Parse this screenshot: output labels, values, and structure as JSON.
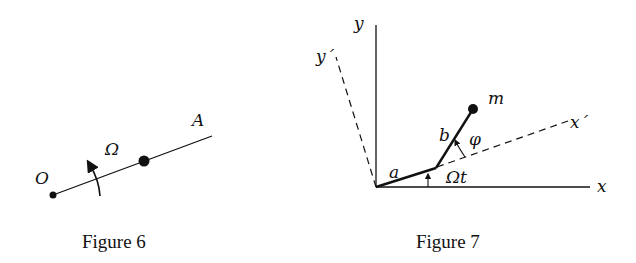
{
  "figures": [
    {
      "caption": "Figure 6",
      "labels": {
        "origin": "O",
        "end": "A",
        "omega": "Ω"
      },
      "elements": [
        "rod O-A",
        "bead on rod",
        "rotation arrow Ω"
      ]
    },
    {
      "caption": "Figure 7",
      "labels": {
        "x": "x",
        "y": "y",
        "x_prime": "x´",
        "y_prime": "y´",
        "a": "a",
        "b": "b",
        "m": "m",
        "phi": "φ",
        "omega_t": "Ωt"
      },
      "elements": [
        "fixed axes x,y",
        "rotating dashed axes x´,y´",
        "arm a",
        "pendulum b",
        "mass m",
        "angle Ωt",
        "angle φ"
      ]
    }
  ],
  "colors": {
    "ink": "#111111",
    "background": "#ffffff"
  }
}
